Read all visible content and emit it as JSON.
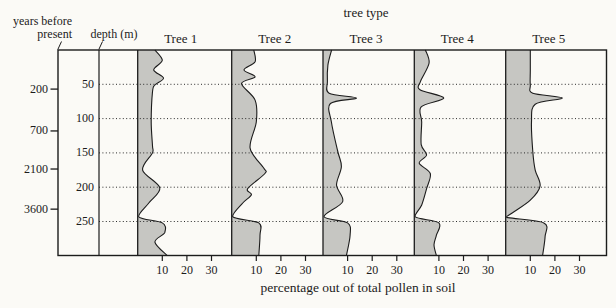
{
  "chart_data": {
    "type": "area",
    "title": "tree type",
    "xlabel": "percentage out of total pollen in soil",
    "x_ticks": [
      10,
      20,
      30
    ],
    "x_percent_range_per_panel": [
      0,
      37
    ],
    "grid": "dotted horizontal lines at each depth tick",
    "depth_axis": {
      "label": "depth (m)",
      "ticks": [
        50,
        100,
        150,
        200,
        250
      ],
      "range_m": [
        0,
        300
      ]
    },
    "years_axis": {
      "label": [
        "years before",
        "present"
      ],
      "ticks": [
        {
          "label": "200",
          "depth_equiv_m": 57
        },
        {
          "label": "700",
          "depth_equiv_m": 118
        },
        {
          "label": "2100",
          "depth_equiv_m": 173.5
        },
        {
          "label": "3600",
          "depth_equiv_m": 232
        }
      ]
    },
    "series": [
      {
        "name": "Tree 1",
        "points_depth_pct": [
          [
            0,
            7
          ],
          [
            15,
            10
          ],
          [
            29,
            6.5
          ],
          [
            41,
            10.5
          ],
          [
            51,
            7
          ],
          [
            61,
            6
          ],
          [
            105,
            5.5
          ],
          [
            140,
            6
          ],
          [
            150,
            6
          ],
          [
            175,
            2
          ],
          [
            201,
            9
          ],
          [
            223,
            4.5
          ],
          [
            243,
            0.4
          ],
          [
            252,
            10
          ],
          [
            266,
            11
          ],
          [
            280,
            7
          ],
          [
            300,
            12
          ]
        ]
      },
      {
        "name": "Tree 2",
        "points_depth_pct": [
          [
            0,
            9
          ],
          [
            17,
            9.5
          ],
          [
            29,
            5
          ],
          [
            39,
            9.5
          ],
          [
            49,
            4
          ],
          [
            73,
            9.5
          ],
          [
            105,
            10
          ],
          [
            143,
            7.5
          ],
          [
            172,
            13
          ],
          [
            180,
            13.5
          ],
          [
            202,
            6.5
          ],
          [
            211,
            8
          ],
          [
            223,
            4.5
          ],
          [
            243,
            0.4
          ],
          [
            252,
            11
          ],
          [
            270,
            11.5
          ],
          [
            300,
            11
          ]
        ]
      },
      {
        "name": "Tree 3",
        "points_depth_pct": [
          [
            0,
            3.5
          ],
          [
            22,
            2
          ],
          [
            46,
            1.8
          ],
          [
            63,
            2.5
          ],
          [
            70,
            13.6
          ],
          [
            78,
            3
          ],
          [
            105,
            3.4
          ],
          [
            148,
            6
          ],
          [
            170,
            7.5
          ],
          [
            197,
            5.5
          ],
          [
            221,
            8
          ],
          [
            243,
            0.4
          ],
          [
            252,
            10
          ],
          [
            270,
            11
          ],
          [
            300,
            9.5
          ]
        ]
      },
      {
        "name": "Tree 4",
        "points_depth_pct": [
          [
            0,
            4.5
          ],
          [
            19,
            6
          ],
          [
            46,
            2.5
          ],
          [
            58,
            2.3
          ],
          [
            70,
            12
          ],
          [
            83,
            2.8
          ],
          [
            105,
            3
          ],
          [
            138,
            2.8
          ],
          [
            153,
            5
          ],
          [
            165,
            2
          ],
          [
            180,
            6.5
          ],
          [
            202,
            5
          ],
          [
            226,
            3
          ],
          [
            243,
            0.3
          ],
          [
            252,
            10
          ],
          [
            270,
            9
          ],
          [
            284,
            8
          ],
          [
            300,
            9
          ]
        ]
      },
      {
        "name": "Tree 5",
        "points_depth_pct": [
          [
            0,
            10
          ],
          [
            30,
            10
          ],
          [
            51,
            10
          ],
          [
            63,
            11
          ],
          [
            70,
            23
          ],
          [
            79,
            12
          ],
          [
            105,
            10.5
          ],
          [
            148,
            11
          ],
          [
            175,
            12
          ],
          [
            198,
            14
          ],
          [
            219,
            10
          ],
          [
            238,
            2.5
          ],
          [
            244,
            0.4
          ],
          [
            252,
            15.5
          ],
          [
            272,
            16
          ],
          [
            300,
            15
          ]
        ]
      }
    ],
    "colors": {
      "area_fill": "#c6c6c2",
      "line": "#1c1c1c",
      "background": "#fbfaf6"
    }
  }
}
